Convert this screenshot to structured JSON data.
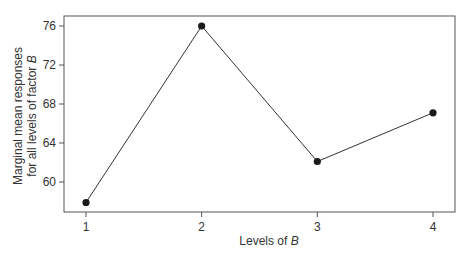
{
  "chart_data": {
    "type": "line",
    "title": "",
    "xlabel": "Levels of B",
    "xlabel_parts": {
      "prefix": "Levels of ",
      "italic": "B"
    },
    "ylabel": "Marginal mean responses for all levels of factor B",
    "ylabel_line1": "Marginal mean responses",
    "ylabel_line2_parts": {
      "prefix": "for all levels of factor ",
      "italic": "B"
    },
    "categories": [
      "1",
      "2",
      "3",
      "4"
    ],
    "x": [
      1,
      2,
      3,
      4
    ],
    "values": [
      57.9,
      76.0,
      62.1,
      67.1
    ],
    "series": [
      {
        "name": "Marginal mean",
        "values": [
          57.9,
          76.0,
          62.1,
          67.1
        ]
      }
    ],
    "yticks": [
      60,
      64,
      68,
      72,
      76
    ],
    "xticks": [
      1,
      2,
      3,
      4
    ],
    "ylim": [
      57.0,
      77.0
    ],
    "xlim": [
      0.8,
      4.2
    ],
    "grid": false,
    "legend": null,
    "colors": {
      "line": "#333333",
      "marker": "#1a1a1a",
      "axis": "#555555"
    }
  }
}
